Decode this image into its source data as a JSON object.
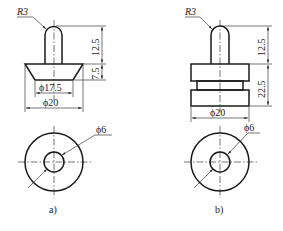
{
  "figure_a": {
    "caption": "a)",
    "radius_label": "R3",
    "dim_height_top": "12.5",
    "dim_height_bottom": "7.5",
    "dim_inner_diameter": "ϕ17.5",
    "dim_outer_diameter": "ϕ20",
    "dim_hole_diameter": "ϕ6"
  },
  "figure_b": {
    "caption": "b)",
    "radius_label": "R3",
    "dim_height_top": "12.5",
    "dim_height_bottom": "22.5",
    "dim_outer_diameter": "ϕ20",
    "dim_hole_diameter": "ϕ6"
  },
  "colors": {
    "line": "#1a1a1a",
    "background": "#ffffff"
  }
}
